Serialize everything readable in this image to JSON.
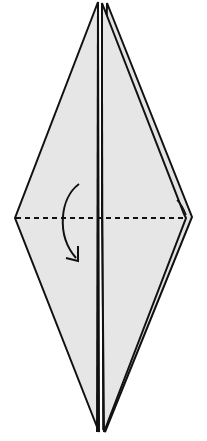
{
  "diagram": {
    "type": "origami-step",
    "colors": {
      "paper": "#e6e6e6",
      "stroke": "#111111",
      "background": "#ffffff"
    },
    "elements": [
      {
        "name": "back-flap",
        "shape": "kite"
      },
      {
        "name": "front-left-flap",
        "shape": "kite-half"
      },
      {
        "name": "front-right-flap",
        "shape": "kite-half"
      },
      {
        "name": "valley-fold-line",
        "style": "dashed"
      },
      {
        "name": "fold-arrow",
        "direction": "down"
      }
    ],
    "label": "Valley fold top down along dashed line"
  }
}
